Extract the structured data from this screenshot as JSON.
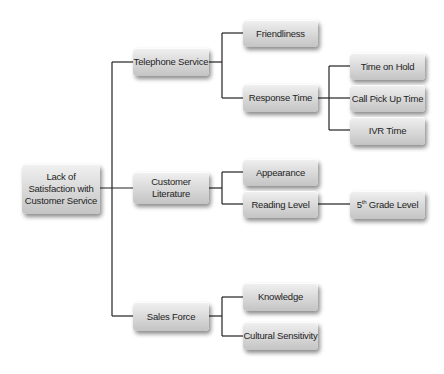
{
  "diagram": {
    "type": "tree",
    "root": {
      "label_lines": [
        "Lack of",
        "Satisfaction with",
        "Customer Service"
      ]
    },
    "level1": [
      {
        "label": "Telephone Service"
      },
      {
        "label_lines": [
          "Customer",
          "Literature"
        ]
      },
      {
        "label": "Sales Force"
      }
    ],
    "level2": {
      "telephone_service": [
        {
          "label": "Friendliness"
        },
        {
          "label": "Response Time"
        }
      ],
      "customer_literature": [
        {
          "label": "Appearance"
        },
        {
          "label": "Reading Level"
        }
      ],
      "sales_force": [
        {
          "label": "Knowledge"
        },
        {
          "label": "Cultural Sensitivity"
        }
      ]
    },
    "level3": {
      "response_time": [
        {
          "label": "Time on Hold"
        },
        {
          "label": "Call Pick Up Time"
        },
        {
          "label": "IVR Time"
        }
      ],
      "reading_level": [
        {
          "label_prefix": "5",
          "label_sup": "th",
          "label_suffix": " Grade Level"
        }
      ]
    },
    "colors": {
      "line": "#222222",
      "box_top": "#f1f1f1",
      "box_bottom": "#c4c4c4",
      "text": "#1e1e1e"
    }
  }
}
